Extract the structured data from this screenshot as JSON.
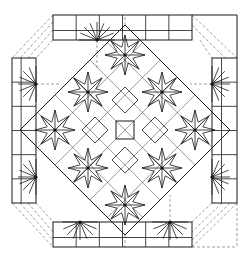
{
  "diagram": {
    "title": "",
    "colors": {
      "line": "#1a1a1a",
      "dashed": "#8a8a8a",
      "background": "#ffffff"
    },
    "diamond": {
      "top": [
        125,
        25
      ],
      "right": [
        230,
        130
      ],
      "bottom": [
        125,
        235
      ],
      "left": [
        20,
        130
      ]
    },
    "strips": [
      {
        "name": "top",
        "x": 53,
        "y": 15,
        "w": 139,
        "h": 25,
        "rosette_hubs": [
          [
            97,
            40
          ],
          [
            207,
            40
          ]
        ]
      },
      {
        "name": "bottom",
        "x": 53,
        "y": 222,
        "w": 139,
        "h": 25,
        "rosette_hubs": [
          [
            80,
            222
          ],
          [
            170,
            222
          ]
        ]
      },
      {
        "name": "left",
        "x": 12,
        "y": 58,
        "w": 24,
        "h": 145,
        "rosette_hubs": [
          [
            36,
            84
          ],
          [
            36,
            177
          ]
        ]
      },
      {
        "name": "right",
        "x": 212,
        "y": 58,
        "w": 25,
        "h": 145,
        "rosette_hubs": [
          [
            212,
            84
          ],
          [
            212,
            177
          ]
        ]
      }
    ],
    "rosettes": [
      [
        88,
        92
      ],
      [
        162,
        92
      ],
      [
        88,
        168
      ],
      [
        162,
        168
      ],
      [
        125,
        55
      ],
      [
        125,
        205
      ],
      [
        55,
        130
      ],
      [
        195,
        130
      ]
    ],
    "center_square": [
      125,
      130
    ]
  }
}
